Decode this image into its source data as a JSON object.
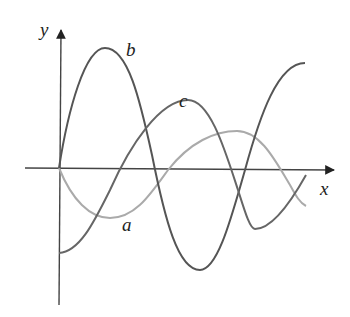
{
  "diagram": {
    "axes": {
      "x_label": "x",
      "y_label": "y"
    },
    "curves": [
      {
        "label": "a",
        "color": "#aaaaaa",
        "description": "starts at origin, dips to trough, rises to peak, dips again"
      },
      {
        "label": "b",
        "color": "#555555",
        "description": "starts at origin, rises to high peak, falls to deep trough, rises again"
      },
      {
        "label": "c",
        "color": "#666666",
        "description": "starts below origin, rises to peak, falls to trough, rises"
      }
    ]
  }
}
